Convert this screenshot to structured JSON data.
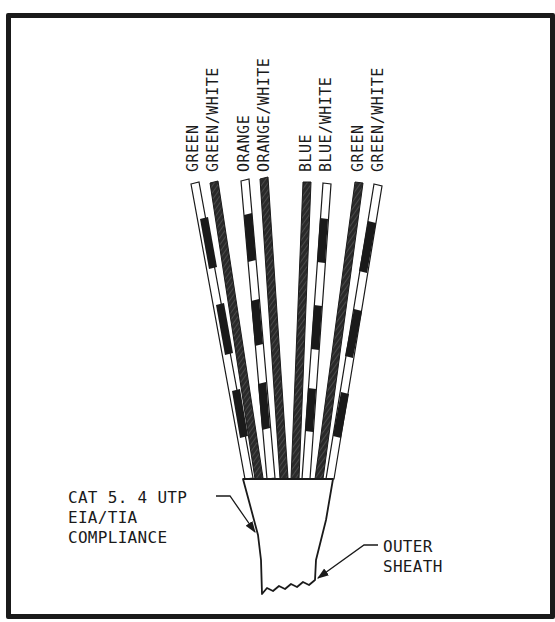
{
  "diagram": {
    "wires": [
      {
        "label": "GREEN",
        "style": "striped",
        "top": [
          195,
          183
        ],
        "bottom": [
          249,
          478
        ]
      },
      {
        "label": "GREEN/WHITE",
        "style": "solid",
        "top": [
          214,
          182
        ],
        "bottom": [
          259,
          478
        ]
      },
      {
        "label": "ORANGE",
        "style": "striped",
        "top": [
          245,
          180
        ],
        "bottom": [
          271,
          478
        ]
      },
      {
        "label": "ORANGE/WHITE",
        "style": "solid",
        "top": [
          264,
          178
        ],
        "bottom": [
          284,
          478
        ]
      },
      {
        "label": "BLUE",
        "style": "solid",
        "top": [
          307,
          182
        ],
        "bottom": [
          295,
          478
        ]
      },
      {
        "label": "BLUE/WHITE",
        "style": "striped",
        "top": [
          327,
          183
        ],
        "bottom": [
          306,
          478
        ]
      },
      {
        "label": "GREEN",
        "style": "solid",
        "top": [
          359,
          182
        ],
        "bottom": [
          319,
          478
        ]
      },
      {
        "label": "GREEN/WHITE",
        "style": "striped",
        "top": [
          378,
          184
        ],
        "bottom": [
          330,
          478
        ]
      }
    ],
    "callouts": {
      "cable_spec": {
        "lines": [
          "CAT 5. 4 UTP",
          "EIA/TIA",
          "COMPLIANCE"
        ]
      },
      "sheath": {
        "lines": [
          "OUTER",
          "SHEATH"
        ]
      }
    },
    "colors": {
      "ink": "#1a1a1a",
      "background": "#ffffff"
    }
  }
}
